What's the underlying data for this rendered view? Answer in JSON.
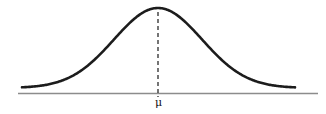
{
  "figure": {
    "background": "#ffffff"
  },
  "colors": {
    "curve": "#1c1c1c",
    "axis": "#8c8c8c",
    "mean_line": "#2b2b2b",
    "label": "#111111"
  },
  "chart_data": {
    "type": "line",
    "title": "",
    "xlabel": "",
    "ylabel": "",
    "grid": false,
    "legend": "none",
    "curve": {
      "function": "gaussian",
      "mean": 0,
      "sd": 1,
      "x_range": [
        -3.1,
        3.1
      ],
      "peak_above": "μ"
    },
    "x_ticks": [
      "μ"
    ],
    "annotations": [
      {
        "text": "μ",
        "x": 0,
        "placement": "below-axis-at-mean"
      },
      {
        "type": "dashed-vertical-line",
        "x": 0,
        "from": "curve-peak",
        "to": "axis"
      }
    ]
  }
}
